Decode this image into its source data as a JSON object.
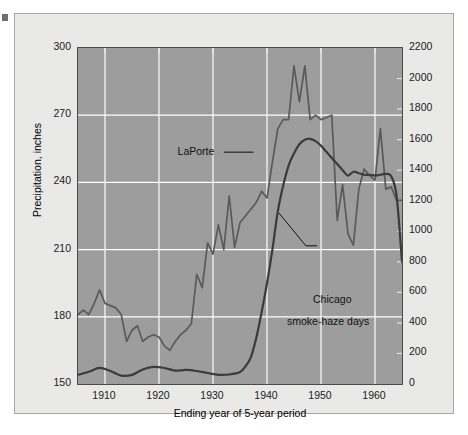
{
  "chart_data": {
    "type": "line",
    "title": "",
    "xlabel": "Ending year of 5-year period",
    "ylabel": "Precipitation, inches",
    "y2label": "Number of days with smoke and haze at Chicago",
    "xlim": [
      1905,
      1965
    ],
    "ylim": [
      150,
      300
    ],
    "y2lim": [
      0,
      2200
    ],
    "grid": true,
    "legend_position": "inline-annotations",
    "xticks": [
      "1910",
      "1920",
      "1930",
      "1940",
      "1950",
      "1960"
    ],
    "xtick_values": [
      1910,
      1920,
      1930,
      1940,
      1950,
      1960
    ],
    "yticks": [
      "150",
      "180",
      "210",
      "240",
      "270",
      "300"
    ],
    "ytick_values": [
      150,
      180,
      210,
      240,
      270,
      300
    ],
    "y2ticks": [
      "0",
      "200",
      "400",
      "600",
      "800",
      "1000",
      "1200",
      "1400",
      "1600",
      "1800",
      "2000",
      "2200"
    ],
    "y2tick_values": [
      0,
      200,
      400,
      600,
      800,
      1000,
      1200,
      1400,
      1600,
      1800,
      2000,
      2200
    ],
    "annotations": [
      {
        "text": "LaPorte",
        "x": 1929,
        "y": 254
      },
      {
        "text": "Chicago",
        "x": 1950,
        "y": 188
      },
      {
        "text": "smoke-haze days",
        "x": 1950,
        "y": 183
      }
    ],
    "series": [
      {
        "name": "LaPorte",
        "axis": "left",
        "unit": "inches",
        "color": "#5a5a5a",
        "x": [
          1905,
          1906,
          1907,
          1908,
          1909,
          1910,
          1911,
          1912,
          1913,
          1914,
          1915,
          1916,
          1917,
          1918,
          1919,
          1920,
          1921,
          1922,
          1923,
          1924,
          1925,
          1926,
          1927,
          1928,
          1929,
          1930,
          1931,
          1932,
          1933,
          1934,
          1935,
          1936,
          1937,
          1938,
          1939,
          1940,
          1941,
          1942,
          1943,
          1944,
          1945,
          1946,
          1947,
          1948,
          1949,
          1950,
          1951,
          1952,
          1953,
          1954,
          1955,
          1956,
          1957,
          1958,
          1959,
          1960,
          1961,
          1962,
          1963,
          1964,
          1965
        ],
        "values": [
          181,
          183,
          181,
          186,
          192,
          186,
          185,
          184,
          181,
          169,
          174,
          176,
          169,
          171,
          172,
          171,
          167,
          165,
          169,
          172,
          174,
          177,
          199,
          193,
          213,
          208,
          221,
          210,
          234,
          211,
          222,
          225,
          228,
          231,
          236,
          233,
          249,
          264,
          268,
          268,
          292,
          276,
          292,
          268,
          270,
          268,
          269,
          270,
          223,
          239,
          217,
          212,
          237,
          246,
          243,
          241,
          264,
          237,
          238,
          232,
          232
        ]
      },
      {
        "name": "Chicago smoke-haze days",
        "axis": "right",
        "unit": "days",
        "color": "#3b3b3b",
        "x": [
          1905,
          1907,
          1909,
          1911,
          1913,
          1915,
          1917,
          1919,
          1921,
          1923,
          1925,
          1927,
          1929,
          1931,
          1933,
          1935,
          1936,
          1937,
          1938,
          1939,
          1940,
          1941,
          1942,
          1943,
          1944,
          1945,
          1946,
          1947,
          1948,
          1949,
          1950,
          1951,
          1952,
          1953,
          1954,
          1955,
          1956,
          1957,
          1958,
          1959,
          1960,
          1961,
          1962,
          1963,
          1964,
          1965
        ],
        "values": [
          60,
          80,
          105,
          85,
          55,
          60,
          95,
          112,
          105,
          88,
          92,
          85,
          72,
          60,
          62,
          78,
          115,
          175,
          300,
          470,
          660,
          880,
          1130,
          1300,
          1430,
          1510,
          1570,
          1600,
          1605,
          1590,
          1560,
          1520,
          1480,
          1440,
          1400,
          1365,
          1390,
          1380,
          1370,
          1370,
          1365,
          1370,
          1375,
          1360,
          1230,
          800
        ]
      }
    ]
  },
  "axes": {
    "y_title": "Precipitation, inches",
    "y2_title": "Number of days with smoke and haze at Chicago",
    "x_title": "Ending year of 5-year period"
  },
  "colors": {
    "plot_background": "#9d9d9d",
    "panel_background": "#e9e9e7",
    "grid": "#ffffff",
    "laporte_line": "#5a5a5a",
    "chicago_line": "#3b3b3b",
    "frame": "#4a4a4a",
    "text": "#1c1c1c"
  }
}
